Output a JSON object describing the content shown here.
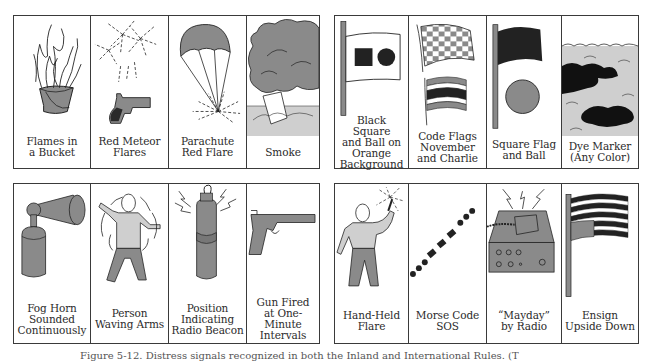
{
  "figure": {
    "groups": [
      {
        "name": "top-left",
        "panels": [
          {
            "id": "flames-in-bucket",
            "label": "Flames in\na Bucket",
            "icon": "flames-bucket-icon"
          },
          {
            "id": "red-meteor-flares",
            "label": "Red Meteor\nFlares",
            "icon": "flare-pistol-icon"
          },
          {
            "id": "parachute-red-flare",
            "label": "Parachute\nRed Flare",
            "icon": "parachute-flare-icon"
          },
          {
            "id": "smoke",
            "label": "Smoke",
            "icon": "smoke-canister-icon"
          }
        ]
      },
      {
        "name": "top-right",
        "panels": [
          {
            "id": "black-square-and-ball",
            "label": "Black Square\nand Ball on\nOrange\nBackground",
            "icon": "square-ball-flag-icon"
          },
          {
            "id": "code-flags-november-charlie",
            "label": "Code Flags\nNovember\nand Charlie",
            "icon": "code-flags-icon"
          },
          {
            "id": "square-flag-and-ball",
            "label": "Square Flag\nand Ball",
            "icon": "flag-and-ball-icon"
          },
          {
            "id": "dye-marker",
            "label": "Dye Marker\n(Any Color)",
            "icon": "dye-marker-icon"
          }
        ]
      },
      {
        "name": "bottom-left",
        "panels": [
          {
            "id": "fog-horn",
            "label": "Fog Horn\nSounded\nContinuously",
            "icon": "fog-horn-icon"
          },
          {
            "id": "person-waving-arms",
            "label": "Person\nWaving Arms",
            "icon": "waving-person-icon"
          },
          {
            "id": "radio-beacon",
            "label": "Position\nIndicating\nRadio Beacon",
            "icon": "radio-beacon-icon"
          },
          {
            "id": "gun-fired",
            "label": "Gun Fired\nat One-Minute\nIntervals",
            "icon": "gun-icon"
          }
        ]
      },
      {
        "name": "bottom-right",
        "panels": [
          {
            "id": "hand-held-flare",
            "label": "Hand-Held\nFlare",
            "icon": "hand-held-flare-icon"
          },
          {
            "id": "morse-code-sos",
            "label": "Morse Code\nSOS",
            "icon": "morse-sos-icon"
          },
          {
            "id": "mayday-by-radio",
            "label": "“Mayday”\nby Radio",
            "icon": "radio-set-icon"
          },
          {
            "id": "ensign-upside-down",
            "label": "Ensign\nUpside Down",
            "icon": "upside-down-ensign-icon"
          }
        ]
      }
    ],
    "caption": "Figure 5-12. Distress signals recognized in both the Inland and International Rules. (T"
  },
  "colors": {
    "border": "#3a3a3a",
    "fill_gray": "#8a8a8a",
    "light_gray": "#cfcfcf",
    "dark": "#1e1e1e"
  }
}
